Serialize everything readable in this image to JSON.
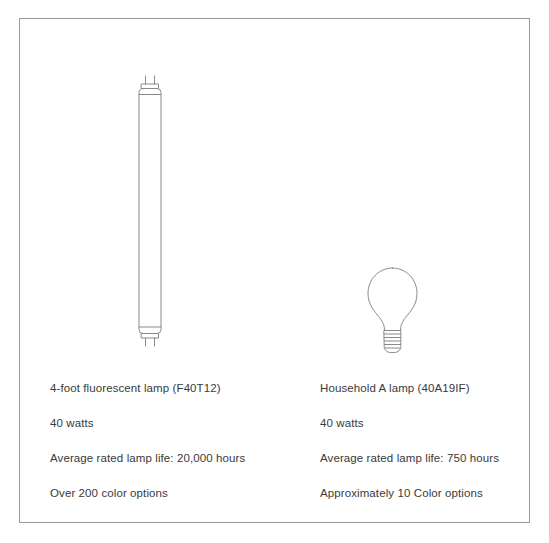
{
  "figure": {
    "border_color": "#9a9a9a",
    "background_color": "#ffffff",
    "line_color": "#8a8a8a",
    "text_color": "#3a3a3a"
  },
  "columns": [
    {
      "id": "fluorescent",
      "illustration": "fluorescent-tube-lamp",
      "specs": [
        "4-foot fluorescent lamp (F40T12)",
        "40 watts",
        "Average rated lamp life: 20,000 hours",
        "Over 200 color options"
      ]
    },
    {
      "id": "incandescent",
      "illustration": "household-a-lamp-bulb",
      "specs": [
        "Household A lamp (40A19IF)",
        "40 watts",
        "Average rated lamp life: 750 hours",
        "Approximately 10 Color options"
      ]
    }
  ]
}
